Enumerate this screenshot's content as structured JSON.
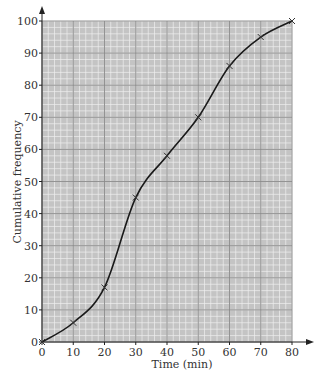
{
  "chart_data": {
    "type": "line",
    "title": "",
    "xlabel": "Time (min)",
    "ylabel": "Cumulative frequency",
    "x": [
      0,
      10,
      20,
      30,
      40,
      50,
      60,
      70,
      80
    ],
    "series": [
      {
        "name": "Cumulative frequency",
        "values": [
          0,
          6,
          17,
          45,
          58,
          70,
          86,
          95,
          100
        ],
        "marker": "x",
        "smooth": true
      }
    ],
    "xlim": [
      0,
      80
    ],
    "ylim": [
      0,
      100
    ],
    "x_ticks": [
      "0",
      "10",
      "20",
      "30",
      "40",
      "50",
      "60",
      "70",
      "80"
    ],
    "y_ticks": [
      "0",
      "10",
      "20",
      "30",
      "40",
      "50",
      "60",
      "70",
      "80",
      "90",
      "100"
    ],
    "grid": true,
    "grid_style": "graph paper (major every 10, minor every 2)",
    "legend": "none"
  },
  "colors": {
    "grid_background": "#c4c4c4",
    "minor_grid": "#efefef",
    "major_grid": "#8a8a8a",
    "curve": "#1a1a1a",
    "text": "#333333"
  }
}
